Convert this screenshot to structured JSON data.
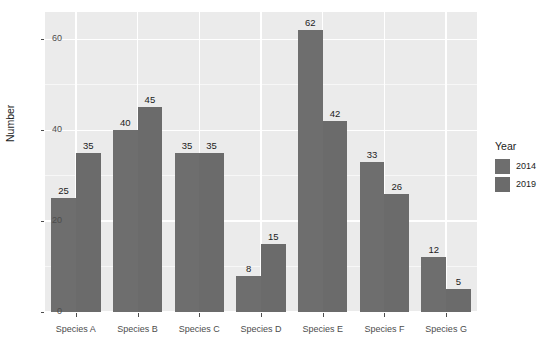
{
  "chart_data": {
    "type": "bar",
    "title": "",
    "xlabel": "",
    "ylabel": "Number",
    "categories": [
      "Species A",
      "Species B",
      "Species C",
      "Species D",
      "Species E",
      "Species F",
      "Species G"
    ],
    "series": [
      {
        "name": "2014",
        "color": "#6e6e6e",
        "values": [
          25,
          40,
          35,
          8,
          62,
          33,
          12
        ]
      },
      {
        "name": "2019",
        "color": "#6b6b6b",
        "values": [
          35,
          45,
          35,
          15,
          42,
          26,
          5
        ]
      }
    ],
    "ylim": [
      0,
      66
    ],
    "yticks": [
      0,
      20,
      40,
      60
    ],
    "ytick_labels": [
      "0",
      "20",
      "40",
      "60"
    ],
    "grid": true,
    "data_labels": true,
    "legend": {
      "title": "Year",
      "position": "right",
      "entries": [
        "2014",
        "2019"
      ]
    },
    "panel_background": "#ebebeb",
    "gridline_color": "#ffffff"
  }
}
